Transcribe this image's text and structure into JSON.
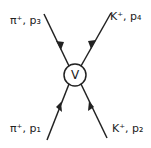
{
  "diagram": {
    "type": "feynman-vertex",
    "vertex_label": "V",
    "particles": [
      {
        "id": "p1",
        "label": "π⁺, p₁",
        "position": "bottom-left",
        "direction": "incoming"
      },
      {
        "id": "p2",
        "label": "K⁺, p₂",
        "position": "bottom-right",
        "direction": "incoming"
      },
      {
        "id": "p3",
        "label": "π⁺, p₃",
        "position": "top-left",
        "direction": "outgoing"
      },
      {
        "id": "p4",
        "label": "K⁺, p₄",
        "position": "top-right",
        "direction": "outgoing"
      }
    ],
    "line_color": "#222222"
  }
}
